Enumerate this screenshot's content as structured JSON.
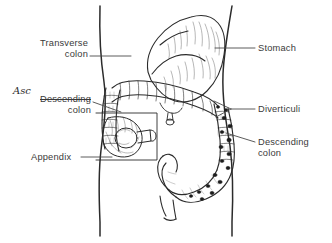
{
  "figure": {
    "background_color": "#ffffff",
    "ink_color": "#2b2b2b",
    "label_color": "#3a3a3a",
    "handwriting_color": "#2b2b2b"
  },
  "labels": {
    "transverse_colon": {
      "line1": "Transverse",
      "line2": "colon",
      "side": "left"
    },
    "descending_colon_left": {
      "line1": "Descending",
      "line2": "colon",
      "side": "left",
      "struck_through": true
    },
    "appendix": {
      "line1": "Appendix",
      "side": "left"
    },
    "stomach": {
      "line1": "Stomach",
      "side": "right"
    },
    "diverticuli": {
      "line1": "Diverticuli",
      "side": "right"
    },
    "descending_colon_right": {
      "line1": "Descending",
      "line2": "colon",
      "side": "right"
    }
  },
  "annotations": {
    "handwritten_correction": {
      "text": "Asc",
      "placed_above": "Descending",
      "style": "handwritten"
    }
  },
  "anatomy": {
    "structures": [
      "torso outline",
      "stomach",
      "transverse colon",
      "ascending colon",
      "descending colon",
      "sigmoid colon",
      "rectum",
      "cecum",
      "appendix",
      "diverticuli"
    ],
    "inset_box": "magnified cecum and appendix"
  }
}
